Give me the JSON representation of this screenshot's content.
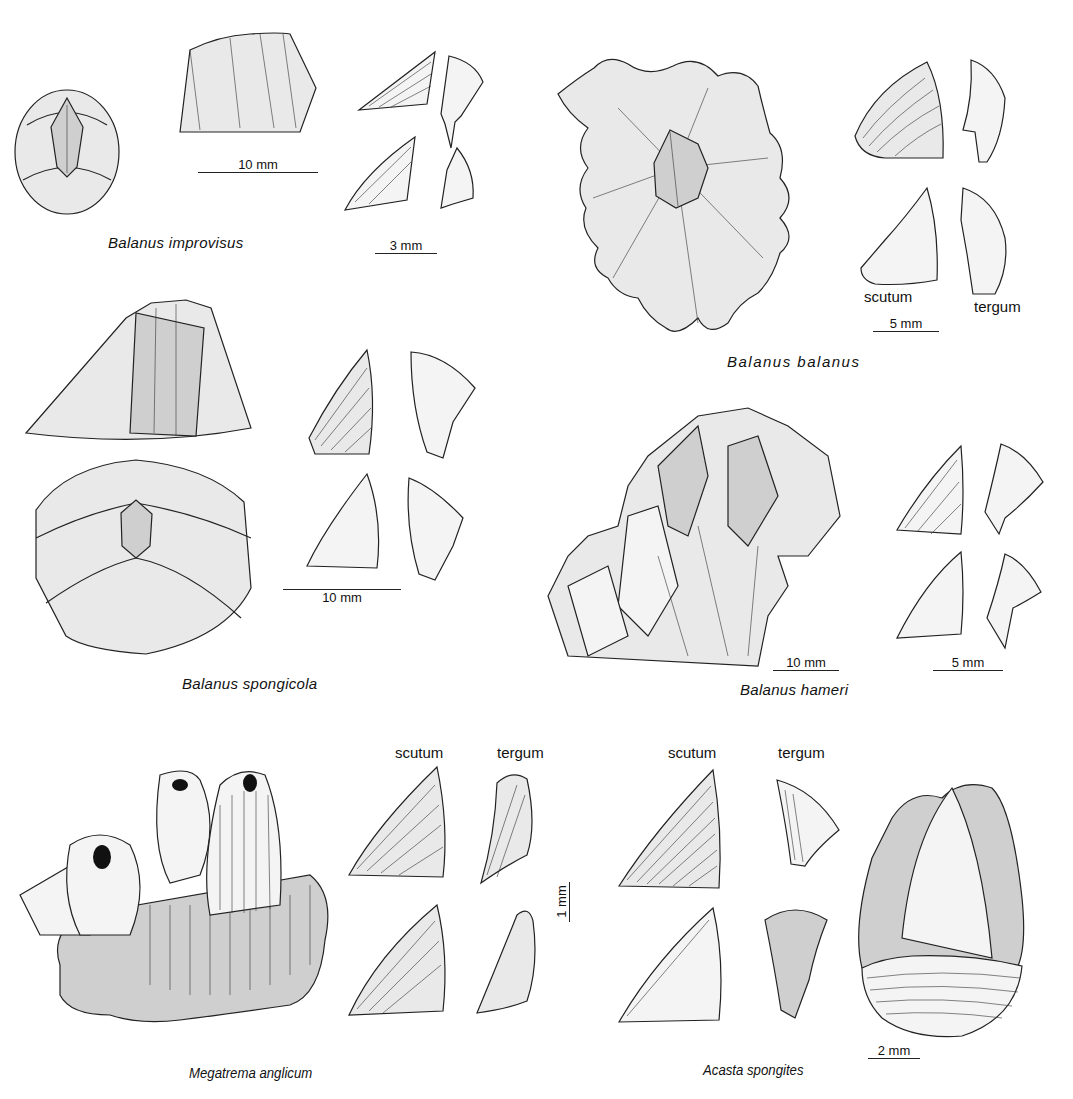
{
  "plate": {
    "species": [
      {
        "id": "balanus-improvisus",
        "name": "Balanus improvisus",
        "scale_bars": [
          "10 mm",
          "3 mm"
        ],
        "views": [
          "apical-view",
          "lateral-view",
          "opercular-valves"
        ]
      },
      {
        "id": "balanus-balanus",
        "name": "Balanus balanus",
        "scale_bars": [
          "5 mm"
        ],
        "valve_labels": [
          "scutum",
          "tergum"
        ],
        "views": [
          "apical-view",
          "opercular-valves"
        ]
      },
      {
        "id": "balanus-spongicola",
        "name": "Balanus spongicola",
        "scale_bars": [
          "10 mm"
        ],
        "views": [
          "lateral-view",
          "apical-view",
          "opercular-valves"
        ]
      },
      {
        "id": "balanus-hameri",
        "name": "Balanus hameri",
        "scale_bars": [
          "10 mm",
          "5 mm"
        ],
        "views": [
          "cluster-view",
          "opercular-valves"
        ]
      },
      {
        "id": "megatrema-anglicum",
        "name": "Megatrema anglicum",
        "scale_bars": [
          "1 mm"
        ],
        "valve_labels": [
          "scutum",
          "tergum"
        ],
        "views": [
          "colony-on-coral",
          "opercular-valves"
        ]
      },
      {
        "id": "acasta-spongites",
        "name": "Acasta spongites",
        "scale_bars": [
          "2 mm"
        ],
        "valve_labels": [
          "scutum",
          "tergum"
        ],
        "views": [
          "opercular-valves",
          "lateral-view"
        ]
      }
    ]
  }
}
